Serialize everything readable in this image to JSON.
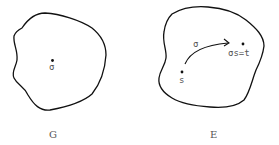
{
  "figures": [
    {
      "id": "G",
      "caption": "G",
      "point": {
        "label": "σ"
      }
    },
    {
      "id": "E",
      "caption": "E",
      "source_point": {
        "label": "s"
      },
      "arrow": {
        "label": "σ"
      },
      "target_point": {
        "label": "σs=t"
      }
    }
  ],
  "colors": {
    "stroke": "#111111",
    "text": "#555555",
    "background": "#ffffff"
  }
}
